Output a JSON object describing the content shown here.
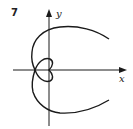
{
  "figure": {
    "number": "7",
    "x_axis_label": "x",
    "y_axis_label": "y",
    "stroke_color": "#1a1a1a",
    "background": "#ffffff"
  }
}
